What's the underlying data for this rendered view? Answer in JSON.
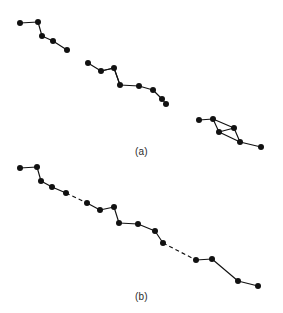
{
  "figure": {
    "background_color": "#ffffff",
    "ink_color": "#111111",
    "width": 283,
    "height": 313,
    "panels": [
      {
        "id": "a",
        "caption": "(a)"
      },
      {
        "id": "b",
        "caption": "(b)"
      }
    ]
  },
  "chart_data": {
    "type": "scatter",
    "title": "",
    "subtitle": "",
    "xlabel": "",
    "ylabel": "",
    "grid": false,
    "legend": null,
    "axes_visible": false,
    "tick_labels": {
      "x": [],
      "y": []
    },
    "xlim": [
      0,
      283
    ],
    "ylim": [
      0,
      313
    ],
    "marker": {
      "shape": "circle",
      "size_px": 4.2,
      "color": "#111111",
      "filled": true
    },
    "annotations": [
      {
        "text": "(a)",
        "x": 141,
        "y": 152,
        "role": "panel-caption"
      },
      {
        "text": "(b)",
        "x": 141,
        "y": 298,
        "role": "panel-caption"
      }
    ],
    "panels": [
      {
        "id": "a",
        "caption": "(a)",
        "description": "three disconnected point chains, all edges solid",
        "series": [
          {
            "name": "cluster-1",
            "linestyle": "solid",
            "points": [
              [
                20,
                23
              ],
              [
                38,
                22
              ],
              [
                42,
                36
              ],
              [
                53,
                41
              ],
              [
                67,
                50
              ]
            ]
          },
          {
            "name": "cluster-2",
            "linestyle": "solid",
            "points": [
              [
                88,
                63
              ],
              [
                101,
                71
              ],
              [
                114,
                68
              ],
              [
                120,
                85
              ],
              [
                139,
                86
              ],
              [
                153,
                90
              ],
              [
                162,
                99
              ],
              [
                166,
                104
              ]
            ],
            "extra_edges": [
              {
                "from": 1,
                "to": 2,
                "linestyle": "solid"
              },
              {
                "from": 2,
                "to": 3,
                "linestyle": "solid"
              }
            ],
            "loop": "triangle formed by points 2, 3 and 4"
          },
          {
            "name": "cluster-3",
            "linestyle": "solid",
            "points": [
              [
                199,
                120
              ],
              [
                213,
                119
              ],
              [
                219,
                132
              ],
              [
                234,
                128
              ],
              [
                240,
                142
              ],
              [
                261,
                147
              ]
            ],
            "extra_edges": [
              {
                "from": 1,
                "to": 3,
                "linestyle": "solid"
              },
              {
                "from": 2,
                "to": 4,
                "linestyle": "solid"
              }
            ],
            "loop": "quadrilateral formed by points 2, 3, 5 and 4"
          }
        ]
      },
      {
        "id": "b",
        "caption": "(b)",
        "description": "one continuous chain; two bridging segments are dashed",
        "series": [
          {
            "name": "chain",
            "linestyle": "mixed",
            "points": [
              [
                20,
                168
              ],
              [
                37,
                167
              ],
              [
                41,
                181
              ],
              [
                52,
                187
              ],
              [
                66,
                193
              ],
              [
                87,
                203
              ],
              [
                100,
                210
              ],
              [
                114,
                207
              ],
              [
                119,
                223
              ],
              [
                138,
                224
              ],
              [
                155,
                231
              ],
              [
                163,
                243
              ],
              [
                196,
                260
              ],
              [
                212,
                259
              ],
              [
                238,
                281
              ],
              [
                258,
                286
              ]
            ],
            "dashed_segments": [
              {
                "from": 4,
                "to": 5,
                "label": "bridge-1"
              },
              {
                "from": 11,
                "to": 12,
                "label": "bridge-2"
              }
            ]
          }
        ]
      }
    ]
  }
}
